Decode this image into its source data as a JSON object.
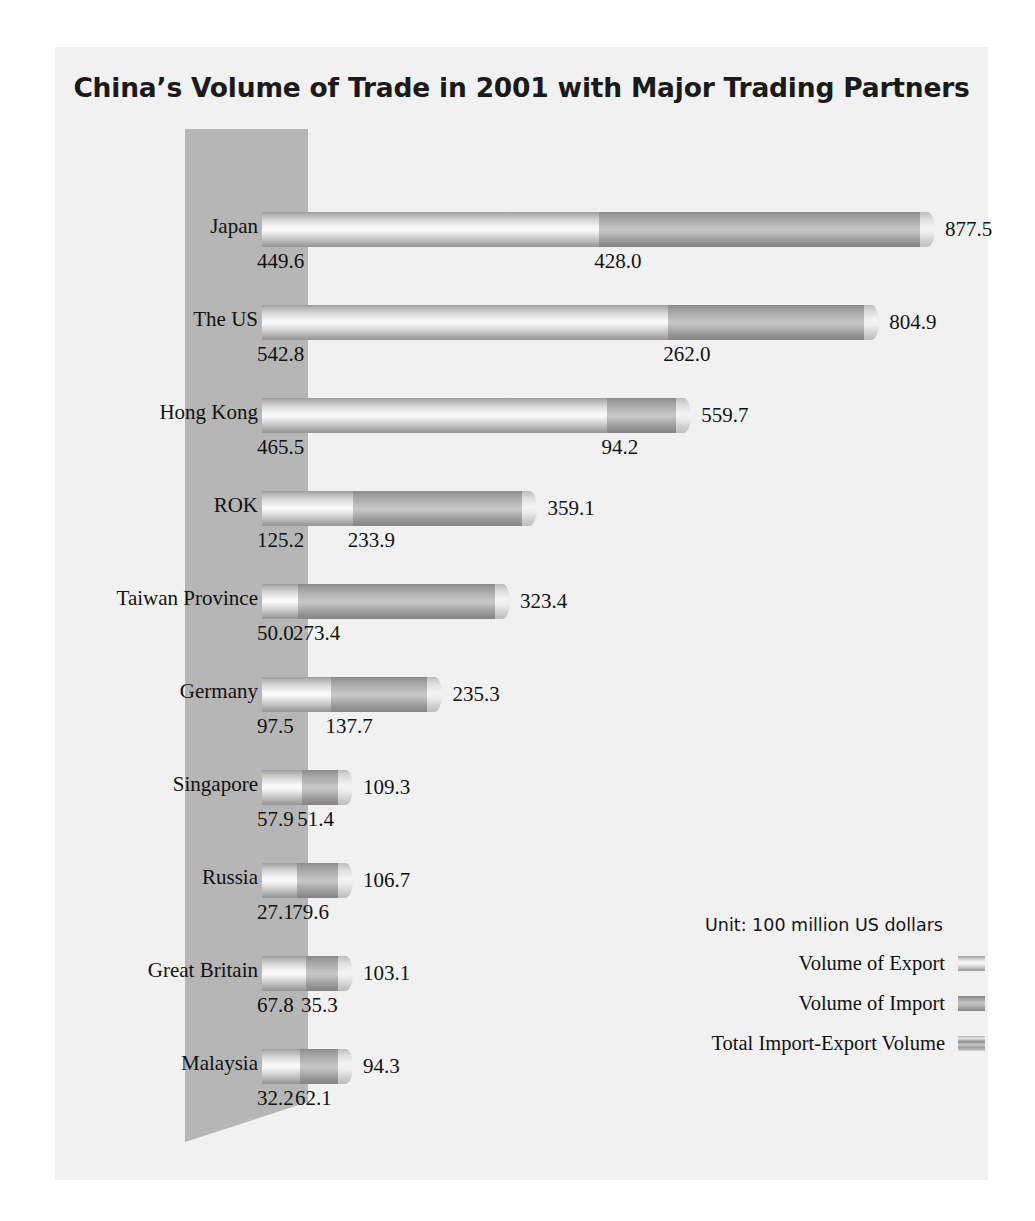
{
  "chart_data": {
    "type": "bar",
    "title": "China’s Volume of Trade in 2001  with Major Trading Partners",
    "xlabel": "",
    "ylabel": "",
    "unit_note": "Unit: 100 million US dollars",
    "orientation": "horizontal",
    "stacked": true,
    "grid": false,
    "legend_position": "bottom-right",
    "xlim": [
      0,
      877.5
    ],
    "categories": [
      "Japan",
      "The US",
      "Hong Kong",
      "ROK",
      "Taiwan Province",
      "Germany",
      "Singapore",
      "Russia",
      "Great Britain",
      "Malaysia"
    ],
    "series": [
      {
        "name": "Volume of Export",
        "values": [
          449.6,
          542.8,
          465.5,
          125.2,
          50.0,
          97.5,
          57.9,
          27.1,
          67.8,
          32.2
        ]
      },
      {
        "name": "Volume of Import",
        "values": [
          428.0,
          262.0,
          94.2,
          233.9,
          273.4,
          137.7,
          51.4,
          79.6,
          35.3,
          62.1
        ]
      }
    ],
    "totals": {
      "name": "Total Import-Export Volume",
      "values": [
        877.5,
        804.9,
        559.7,
        359.1,
        323.4,
        235.3,
        109.3,
        106.7,
        103.1,
        94.3
      ]
    },
    "labels": {
      "export": [
        "449.6",
        "542.8",
        "465.5",
        "125.2",
        "50.0",
        "97.5",
        "57.9",
        "27.1",
        "67.8",
        "32.2"
      ],
      "import": [
        "428.0",
        "262.0",
        "94.2",
        "233.9",
        "273.4",
        "137.7",
        "51.4",
        "79.6",
        "35.3",
        "62.1"
      ],
      "total": [
        "877.5",
        "804.9",
        "559.7",
        "359.1",
        "323.4",
        "235.3",
        "109.3",
        "106.7",
        "103.1",
        "94.3"
      ]
    },
    "legend": [
      {
        "label": "Volume of Export",
        "swatch": "sw-export"
      },
      {
        "label": "Volume of Import",
        "swatch": "sw-import"
      },
      {
        "label": "Total Import-Export Volume",
        "swatch": "sw-total"
      }
    ],
    "colors": {
      "panel_background": "#f1f1f1",
      "page_background": "#ffffff",
      "band": "#b6b6b6",
      "export_bar": "#d8d8d8",
      "import_bar": "#a8a8a8",
      "text": "#111111"
    }
  }
}
